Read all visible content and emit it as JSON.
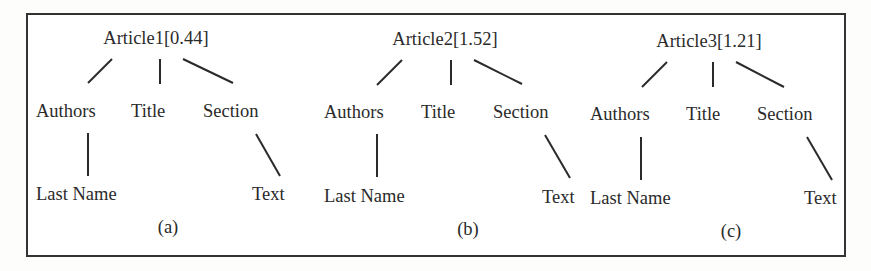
{
  "figure": {
    "trees": [
      {
        "id": "a",
        "root": "Article1[0.44]",
        "article": "Article1",
        "score": "0.44",
        "children": [
          "Authors",
          "Title",
          "Section"
        ],
        "grandchildren": {
          "Authors": "Last Name",
          "Section": "Text"
        },
        "caption": "(a)"
      },
      {
        "id": "b",
        "root": "Article2[1.52]",
        "article": "Article2",
        "score": "1.52",
        "children": [
          "Authors",
          "Title",
          "Section"
        ],
        "grandchildren": {
          "Authors": "Last Name",
          "Section": "Text"
        },
        "caption": "(b)"
      },
      {
        "id": "c",
        "root": "Article3[1.21]",
        "article": "Article3",
        "score": "1.21",
        "children": [
          "Authors",
          "Title",
          "Section"
        ],
        "grandchildren": {
          "Authors": "Last Name",
          "Section": "Text"
        },
        "caption": "(c)"
      }
    ]
  },
  "colors": {
    "ink": "#2a2a2a",
    "frame": "#333333",
    "background": "#ffffff"
  }
}
